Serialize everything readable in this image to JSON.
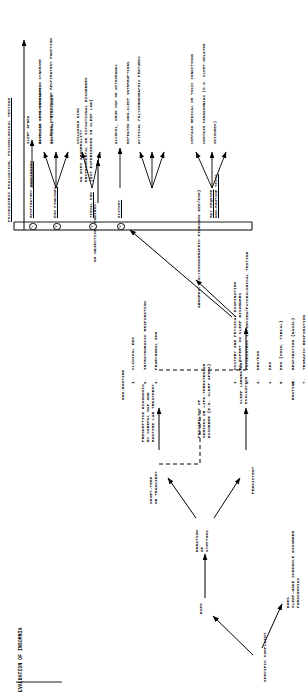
{
  "figure": {
    "title": "EVALUATION OF INSOMNIA",
    "type": "clinical-flowchart"
  },
  "nodes": {
    "specific_complaint": "SPECIFIC COMPLAINT",
    "dims": "DIMS",
    "does_parasomnia": "DOES\nSLEEP-WAKE SCHEDULE DISORDER\nPARASOMNIAS",
    "duration": "DURATION\nOF\nSYMPTOMS",
    "short_term": "SHORT-TERM\nOR TRANSIENT",
    "persistent": "PERSISTENT",
    "presumptive": "PRESUMPTIVE DIAGNOSIS\nBY CAREFUL H&P AND\nROUTINE LAB TREATMENT",
    "possibility": "POSSIBILITY OF\nSERIOUS OR LIFE-THREATENING\nDISORDER (E.G. SLEEP APNEA)",
    "sleep_lab": "SLEEP LABORATORY\nEVALUATION",
    "routine_label": "ROUTINE",
    "nonroutine_label": "NON-ROUTINE",
    "no_objective": "NO OBJECTIVE FINDINGS:",
    "no_dims": "NO DIMS ABNORMALITY\nENVIRONMENTAL OR SITUATIONAL DISORDERS\n(NOT EXPERIENCED IN SLEEP LAB)",
    "abnormal": "ABNORMAL POLYSOMNOGRAPHIC FINDINGS EEG/EOG)"
  },
  "routine_tests": [
    {
      "n": "1.",
      "label": "HISTORY AND PHYSICAL EXAMINATION\nBY EXPERT IN SLEEP DISORDERS"
    },
    {
      "n": "2.",
      "label": "PSYCHIATRIC INTERVIEW/PSYCHOLOGICAL TESTING"
    },
    {
      "n": "3.",
      "label": "EEG/EOG"
    },
    {
      "n": "4.",
      "label": "EKG"
    },
    {
      "n": "5.",
      "label": "EMG (CHIN, TIBIAL)"
    },
    {
      "n": "6.",
      "label": "RESPIRATION (NASAL)"
    },
    {
      "n": "7.",
      "label": "THORACIC RESPIRATION"
    }
  ],
  "nonroutine_tests": [
    {
      "n": "1.",
      "label": "CLINICAL EEG"
    },
    {
      "n": "2.",
      "label": "INTRATHORACIC RESPIRATION"
    },
    {
      "n": "3.",
      "label": "PHARYNGEAL EMG"
    }
  ],
  "results_box": {
    "header": "PSYCHIATRIC EVALUATION, PSYCHOLOGICAL TESTING",
    "groups": [
      {
        "marker": "1",
        "source": "RESPIRATORY MONITORING",
        "findings": [
          "SLEEP APNEA",
          "ALVEOLAR HYPOVENTILATION SYNDROME",
          "ILLNESS COMPROMISING RESPIRATORY FUNCTION"
        ]
      },
      {
        "marker": "2",
        "source": "EMG FINDINGS",
        "findings": [
          "RESTLESS LEGS SYNDROME",
          "NOCTURNAL MYOCLONUS"
        ]
      },
      {
        "marker": "3",
        "source": "TIBIAL EMG",
        "findings": [
          "CHILDHOOD DIMS"
        ]
      },
      {
        "marker": "4",
        "source": "HISTORY",
        "findings": [
          "ALCOHOL, DRUG USE OR WITHDRAWAL",
          "REPEATED NON-SLEEP INTERRUPTIONS",
          "ATYPICAL POLYSOMNOGRAPHIC FEATURES"
        ]
      },
      {
        "marker": "",
        "source": "MAY REQUIRE\nNON-ROUTINE TESTS",
        "findings": [
          "CERTAIN MEDICAL OR TOXIC CONDITIONS",
          "CERTAIN PARASOMNIAS (E.G. SLEEP-RELATED",
          "SEIZURES)"
        ]
      }
    ]
  },
  "colors": {
    "ink": "#000000",
    "paper": "#ffffff"
  }
}
